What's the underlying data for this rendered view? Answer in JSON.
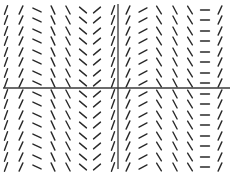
{
  "chart_data": {
    "type": "slope_field",
    "title": "",
    "xlabel": "",
    "ylabel": "",
    "grid": false,
    "legend": null,
    "axes": {
      "horizontal": {
        "y_px": 88,
        "x_start_px": 3,
        "x_end_px": 230
      },
      "vertical": {
        "x_px": 118,
        "y_start_px": 4,
        "y_end_px": 169
      }
    },
    "columns_x_px": [
      6,
      21,
      37,
      53,
      68,
      83,
      97,
      113,
      128,
      143,
      159,
      175,
      190,
      205,
      220
    ],
    "column_slope_angles_deg": [
      70,
      65,
      -25,
      -65,
      -62,
      -40,
      40,
      70,
      65,
      28,
      -58,
      -62,
      -58,
      0,
      65
    ],
    "rows_y_px": [
      10,
      20,
      31,
      41,
      52,
      62,
      73,
      83,
      94,
      104,
      115,
      125,
      136,
      146,
      157,
      167
    ],
    "segment_length_px": 9,
    "note": "Slope depends only on x; every row repeats the same column slopes"
  },
  "colors": {
    "background": "#ffffff",
    "segment": "#2a2a2a",
    "axis": "#3a3a3a"
  }
}
